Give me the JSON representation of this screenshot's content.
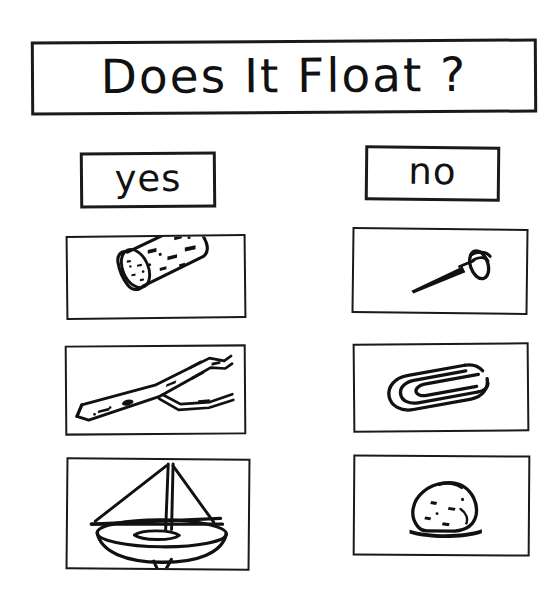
{
  "worksheet": {
    "title": "Does It Float ?",
    "style": "hand-drawn black ink on white paper",
    "ink_color": "#111111",
    "paper_color": "#ffffff",
    "columns": [
      {
        "key": "yes",
        "label": "yes"
      },
      {
        "key": "no",
        "label": "no"
      }
    ],
    "rows": [
      {
        "yes": {
          "icon_name": "cork-icon",
          "object": "cork"
        },
        "no": {
          "icon_name": "pushpin-icon",
          "object": "pushpin"
        }
      },
      {
        "yes": {
          "icon_name": "twig-icon",
          "object": "twig"
        },
        "no": {
          "icon_name": "paperclip-icon",
          "object": "paperclip"
        }
      },
      {
        "yes": {
          "icon_name": "sailboat-icon",
          "object": "toy sailboat"
        },
        "no": {
          "icon_name": "rock-icon",
          "object": "rock"
        }
      }
    ]
  }
}
